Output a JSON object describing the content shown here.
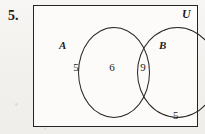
{
  "figure": {
    "problem_number": "5.",
    "universe_label": "U",
    "set_a_label": "A",
    "set_b_label": "B",
    "counts": {
      "a_only": "5",
      "intersection": "6",
      "b_only": "9",
      "outside": "5"
    },
    "colors": {
      "ink": "#262320",
      "paper": "#f4f3f1",
      "inner_paper": "#fcfbfa"
    }
  }
}
